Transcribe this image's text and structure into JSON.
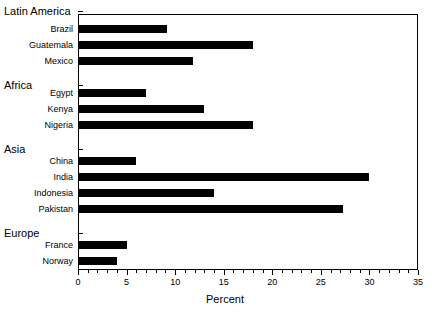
{
  "chart_data": {
    "type": "bar",
    "orientation": "horizontal",
    "title": "",
    "xlabel": "Percent",
    "ylabel": "",
    "xlim": [
      0,
      35
    ],
    "xticks": [
      0,
      5,
      10,
      15,
      20,
      25,
      30,
      35
    ],
    "xtick_labels": [
      "0",
      "5",
      "10",
      "15",
      "20",
      "25",
      "30",
      "35"
    ],
    "minor_tick_step": 1,
    "grid": false,
    "legend": false,
    "bar_color": "#000000",
    "frame_color": "#000000",
    "background": "#ffffff",
    "groups": [
      {
        "name": "Latin America",
        "categories": [
          "Brazil",
          "Guatemala",
          "Mexico"
        ],
        "values": [
          9.2,
          18.0,
          11.8
        ]
      },
      {
        "name": "Africa",
        "categories": [
          "Egypt",
          "Kenya",
          "Nigeria"
        ],
        "values": [
          7.0,
          13.0,
          18.0
        ]
      },
      {
        "name": "Asia",
        "categories": [
          "China",
          "India",
          "Indonesia",
          "Pakistan"
        ],
        "values": [
          6.0,
          30.0,
          14.0,
          27.3
        ]
      },
      {
        "name": "Europe",
        "categories": [
          "France",
          "Norway"
        ],
        "values": [
          5.0,
          4.0
        ]
      }
    ],
    "categories": [
      "Brazil",
      "Guatemala",
      "Mexico",
      "Egypt",
      "Kenya",
      "Nigeria",
      "China",
      "India",
      "Indonesia",
      "Pakistan",
      "France",
      "Norway"
    ],
    "values": [
      9.2,
      18.0,
      11.8,
      7.0,
      13.0,
      18.0,
      6.0,
      30.0,
      14.0,
      27.3,
      5.0,
      4.0
    ]
  },
  "axis": {
    "title": "Percent"
  }
}
